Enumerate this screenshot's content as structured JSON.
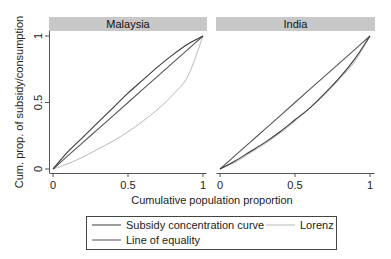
{
  "chart_data": {
    "type": "line",
    "title": "",
    "xlabel": "Cumulative population proportion",
    "ylabel": "Cum. prop. of subsidy/consumption",
    "xlim": [
      0,
      1
    ],
    "ylim": [
      0,
      1
    ],
    "xticks": [
      "0",
      "0.5",
      "1"
    ],
    "yticks": [
      "0",
      "0.5",
      "1"
    ],
    "grid": false,
    "legend_position": "bottom",
    "legend": [
      "Subsidy concentration curve",
      "Lorenz",
      "Line of equality"
    ],
    "colors": {
      "Subsidy concentration curve": "#3a3a3a",
      "Lorenz": "#b8b8b8",
      "Line of equality": "#555555",
      "panel_header": "#c8c8c8"
    },
    "panels": [
      {
        "name": "Malaysia",
        "x": [
          0,
          0.1,
          0.2,
          0.3,
          0.4,
          0.5,
          0.6,
          0.7,
          0.8,
          0.9,
          1.0
        ],
        "series": [
          {
            "name": "Subsidy concentration curve",
            "values": [
              0,
              0.13,
              0.24,
              0.35,
              0.46,
              0.57,
              0.67,
              0.77,
              0.86,
              0.94,
              1.0
            ]
          },
          {
            "name": "Lorenz",
            "values": [
              0,
              0.04,
              0.09,
              0.15,
              0.21,
              0.28,
              0.36,
              0.45,
              0.56,
              0.7,
              1.0
            ]
          },
          {
            "name": "Line of equality",
            "values": [
              0,
              0.1,
              0.2,
              0.3,
              0.4,
              0.5,
              0.6,
              0.7,
              0.8,
              0.9,
              1.0
            ]
          }
        ]
      },
      {
        "name": "India",
        "x": [
          0,
          0.1,
          0.2,
          0.3,
          0.4,
          0.5,
          0.6,
          0.7,
          0.8,
          0.9,
          1.0
        ],
        "series": [
          {
            "name": "Subsidy concentration curve",
            "values": [
              0,
              0.06,
              0.13,
              0.2,
              0.28,
              0.37,
              0.46,
              0.57,
              0.69,
              0.83,
              1.0
            ]
          },
          {
            "name": "Lorenz",
            "values": [
              0,
              0.05,
              0.12,
              0.19,
              0.27,
              0.36,
              0.46,
              0.56,
              0.68,
              0.81,
              1.0
            ]
          },
          {
            "name": "Line of equality",
            "values": [
              0,
              0.1,
              0.2,
              0.3,
              0.4,
              0.5,
              0.6,
              0.7,
              0.8,
              0.9,
              1.0
            ]
          }
        ]
      }
    ]
  }
}
